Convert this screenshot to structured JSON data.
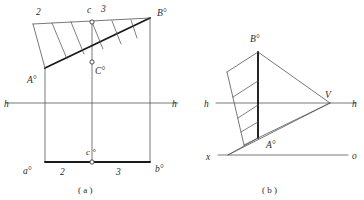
{
  "document": {
    "type": "descriptive-geometry-construction-drawing",
    "background_color": "#ffffff",
    "line_color": "#55555a",
    "bold_line_color": "#1a1a1a",
    "axis_color": "#6a6a70",
    "text_color": "#2b2b2b",
    "width": 364,
    "height": 200
  },
  "figure_a": {
    "caption": "( a )",
    "labels": {
      "two_top": "2",
      "c_top": "c",
      "three_top": "3",
      "b_upper": "B°",
      "c_mid": "C°",
      "a_upper": "A°",
      "h_left": "h",
      "h_right": "h",
      "a_lower": "a°",
      "two_bottom": "2",
      "c_bottom": "c °",
      "three_bottom": "3",
      "b_lower": "b°"
    },
    "geometry": {
      "rect_left_x": 45,
      "rect_right_x": 150,
      "rect_bottom_y": 162,
      "rect_top_y": 18,
      "mid_vertical_x": 92,
      "h_line_y": 103,
      "h_line_x1": 6,
      "h_line_x2": 178,
      "apex_b": [
        150,
        18
      ],
      "point_a": [
        45,
        68
      ],
      "point_c": [
        92,
        62
      ],
      "point_c_top": [
        92,
        22
      ],
      "point_c_bottom": [
        92,
        162
      ],
      "strip_top_left": [
        33,
        24
      ],
      "hatch_count": 5
    }
  },
  "figure_b": {
    "caption": "( b )",
    "labels": {
      "b_upper": "B°",
      "v_point": "V",
      "h_left": "h",
      "h_right": "h",
      "a_upper": "A°",
      "x_left": "x",
      "o_right": "o"
    },
    "geometry": {
      "apex_b": [
        258,
        52
      ],
      "point_a": [
        258,
        138
      ],
      "point_v": [
        330,
        103
      ],
      "h_line_y": 103,
      "h_line_x1": 216,
      "h_line_x2": 356,
      "xo_line_y": 155,
      "xo_line_x1": 218,
      "xo_line_x2": 348,
      "strip_corner_left": [
        227,
        72
      ],
      "strip_corner_lower": [
        244,
        145
      ],
      "hatch_count": 3
    }
  }
}
